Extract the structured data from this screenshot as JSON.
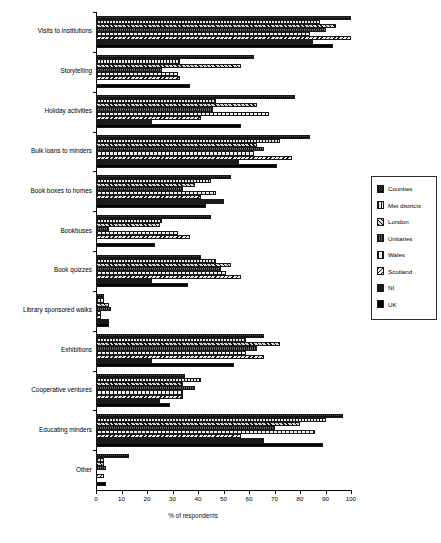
{
  "chart_data": {
    "type": "bar",
    "orientation": "horizontal",
    "title": "",
    "xlabel": "% of respondents",
    "ylabel": "",
    "xlim": [
      0,
      100
    ],
    "xticks": [
      0,
      10,
      20,
      30,
      40,
      50,
      60,
      70,
      80,
      90,
      100
    ],
    "grid": false,
    "legend_position": "right",
    "categories": [
      "Visits to institutions",
      "Storytelling",
      "Holiday activities",
      "Bulk loans to minders",
      "Book boxes to homes",
      "Bookbuses",
      "Book quizzes",
      "Library sponsored walks",
      "Exhibitions",
      "Cooperative ventures",
      "Educating minders",
      "Other"
    ],
    "series": [
      {
        "name": "Counties",
        "pattern": "dark-crosshatch",
        "values": [
          100,
          62,
          78,
          84,
          53,
          45,
          41,
          3,
          66,
          35,
          97,
          13
        ]
      },
      {
        "name": "Met districts",
        "pattern": "vertical-hatch",
        "values": [
          88,
          33,
          47,
          72,
          45,
          26,
          47,
          3,
          59,
          41,
          90,
          3
        ]
      },
      {
        "name": "London",
        "pattern": "diagonal-hatch",
        "values": [
          94,
          57,
          63,
          63,
          39,
          25,
          53,
          5,
          72,
          34,
          80,
          3
        ]
      },
      {
        "name": "Unitaries",
        "pattern": "dense-crosshatch",
        "values": [
          90,
          26,
          46,
          66,
          34,
          5,
          49,
          6,
          63,
          39,
          70,
          4
        ]
      },
      {
        "name": "Wales",
        "pattern": "wide-vertical",
        "values": [
          84,
          32,
          68,
          62,
          47,
          32,
          51,
          2,
          59,
          34,
          86,
          0
        ]
      },
      {
        "name": "Scotland",
        "pattern": "back-diagonal",
        "values": [
          100,
          33,
          41,
          77,
          41,
          37,
          57,
          2,
          66,
          34,
          57,
          3
        ]
      },
      {
        "name": "NI",
        "pattern": "solid-dark",
        "values": [
          85,
          0,
          22,
          56,
          50,
          0,
          22,
          5,
          22,
          25,
          66,
          0
        ]
      },
      {
        "name": "UK",
        "pattern": "solid-black",
        "values": [
          93,
          37,
          57,
          71,
          43,
          23,
          36,
          5,
          54,
          29,
          89,
          4
        ]
      }
    ]
  },
  "legend": {
    "items": [
      {
        "label": "Counties"
      },
      {
        "label": "Met districts"
      },
      {
        "label": "London"
      },
      {
        "label": "Unitaries"
      },
      {
        "label": "Wales"
      },
      {
        "label": "Scotland"
      },
      {
        "label": "NI"
      },
      {
        "label": "UK"
      }
    ]
  }
}
